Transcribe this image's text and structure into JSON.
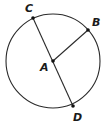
{
  "diagram": {
    "type": "circle-geometry",
    "stroke_color": "#2a2a2a",
    "circle": {
      "cx": 53,
      "cy": 61,
      "r": 47
    },
    "points": [
      {
        "name": "C",
        "x": 33,
        "y": 18,
        "label_x": 25,
        "label_y": 12
      },
      {
        "name": "B",
        "x": 88,
        "y": 30,
        "label_x": 92,
        "label_y": 26
      },
      {
        "name": "A",
        "x": 53,
        "y": 61,
        "label_x": 40,
        "label_y": 71
      },
      {
        "name": "D",
        "x": 73,
        "y": 106,
        "label_x": 73,
        "label_y": 121
      }
    ],
    "segments": [
      {
        "name": "diameter-CD",
        "from": "C",
        "to": "D"
      },
      {
        "name": "radius-AB",
        "from": "A",
        "to": "B"
      }
    ],
    "labels": {
      "C": "C",
      "B": "B",
      "A": "A",
      "D": "D"
    }
  }
}
